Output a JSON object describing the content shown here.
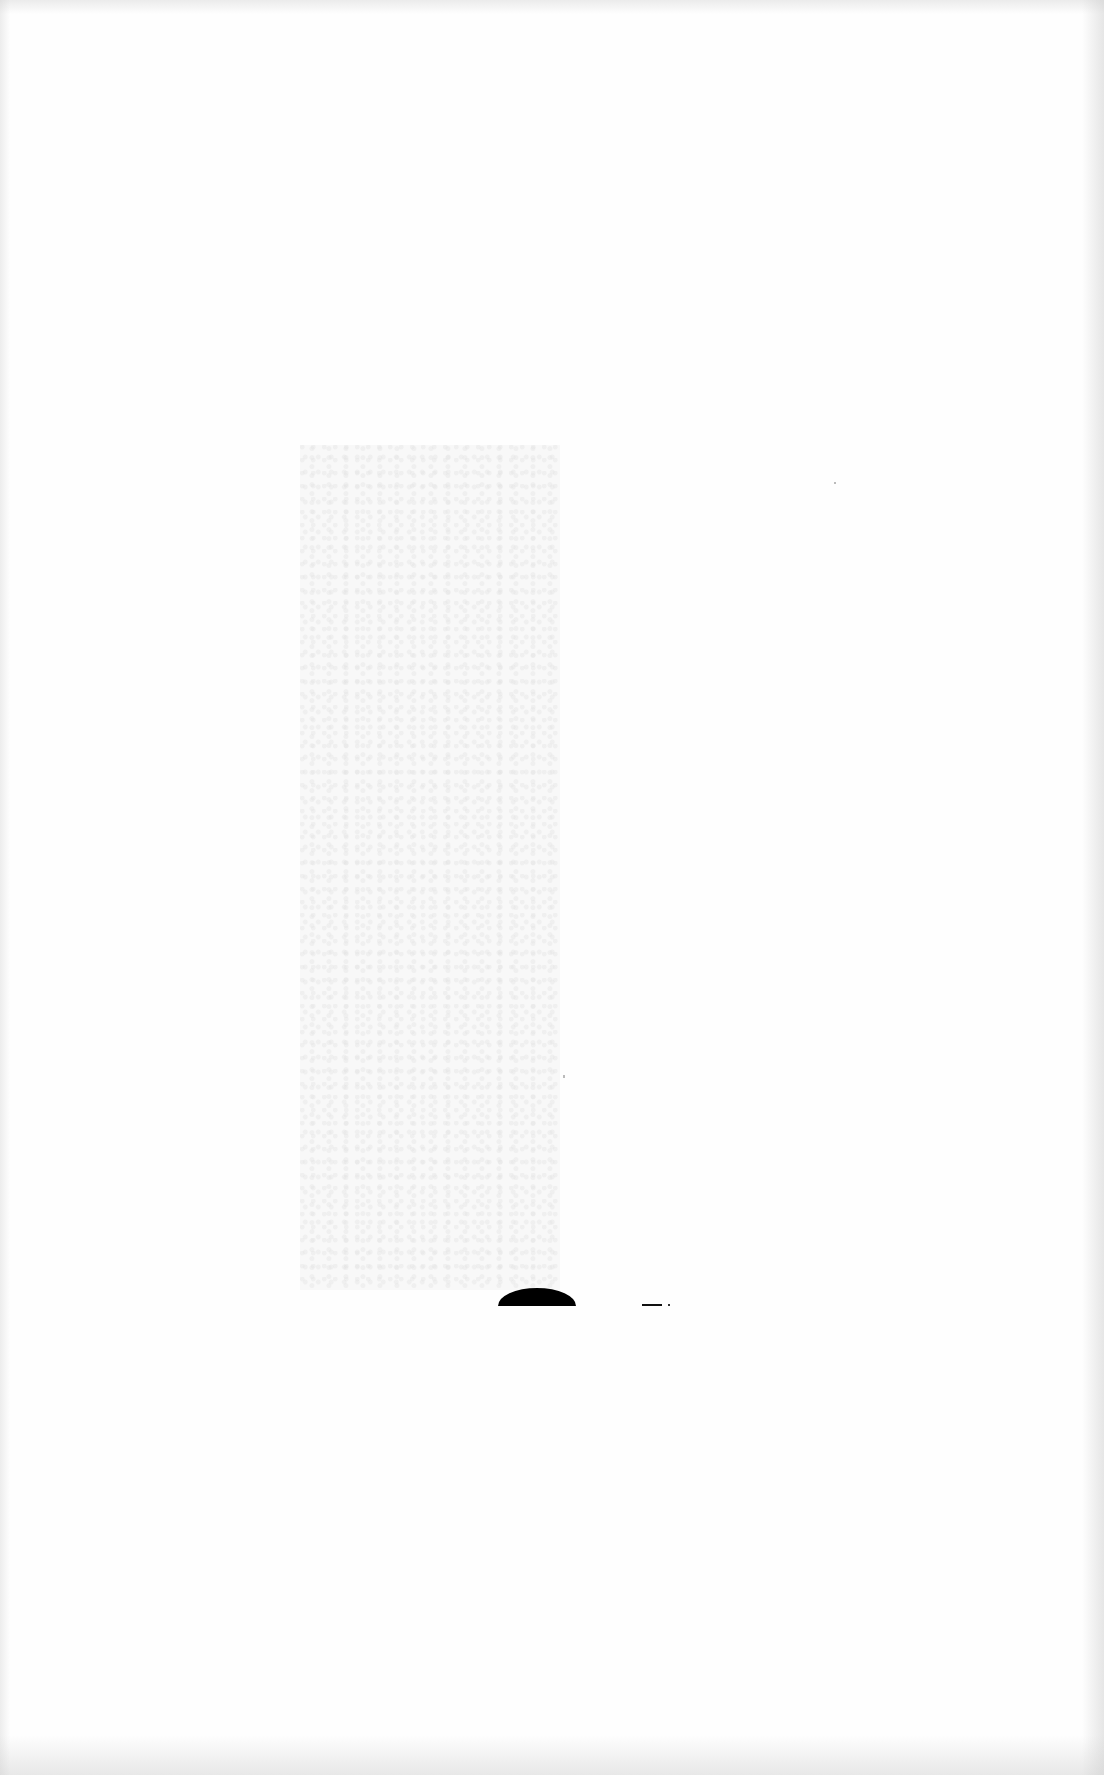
{
  "document": {
    "type": "scanned-page",
    "text_content": "",
    "background_color": "#fefefe",
    "ink_color": "#000000",
    "marks": [
      {
        "name": "ink-dome",
        "x": 498,
        "y": 1288,
        "w": 78,
        "h": 18
      },
      {
        "name": "ink-dash",
        "x": 642,
        "y": 1304,
        "w": 20,
        "h": 2
      }
    ]
  }
}
